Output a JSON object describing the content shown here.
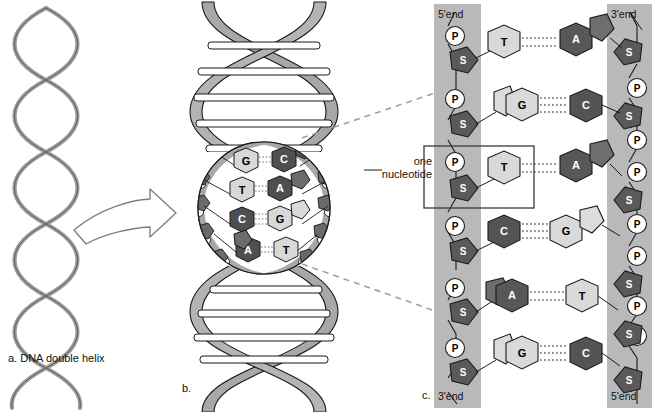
{
  "figure": {
    "panels": [
      {
        "id": "a",
        "caption": "a.  DNA double helix"
      },
      {
        "id": "b",
        "caption": "b."
      },
      {
        "id": "c",
        "caption": "c."
      }
    ]
  },
  "panel_c": {
    "end_labels": {
      "top_left": "5'end",
      "top_right": "3'end",
      "bottom_left": "3'end",
      "bottom_right": "5'end"
    },
    "callout": {
      "line1": "one",
      "line2": "nucleotide"
    },
    "backbone_symbols": {
      "phosphate": "P",
      "sugar": "S"
    },
    "rows": [
      {
        "left_base": "T",
        "right_base": "A",
        "bonds": 2
      },
      {
        "left_base": "G",
        "right_base": "C",
        "bonds": 3
      },
      {
        "left_base": "T",
        "right_base": "A",
        "bonds": 2
      },
      {
        "left_base": "C",
        "right_base": "G",
        "bonds": 3
      },
      {
        "left_base": "A",
        "right_base": "T",
        "bonds": 2
      },
      {
        "left_base": "G",
        "right_base": "C",
        "bonds": 3
      }
    ]
  },
  "panel_b": {
    "base_pairs": [
      {
        "left_base": "G",
        "right_base": "C"
      },
      {
        "left_base": "T",
        "right_base": "A"
      },
      {
        "left_base": "C",
        "right_base": "G"
      },
      {
        "left_base": "A",
        "right_base": "T"
      }
    ]
  },
  "colors": {
    "ribbon": "#a8a8a8",
    "ribbon_dark": "#8f8f8f",
    "backbone_band": "#b8b8b8",
    "base_dark": "#585858",
    "base_light": "#d6d6d6",
    "base_mid": "#cfcfcf",
    "sugar": "#555555",
    "phosphate": "#ffffff",
    "outline": "#1a1a1a",
    "dash": "#9a9a9a"
  }
}
